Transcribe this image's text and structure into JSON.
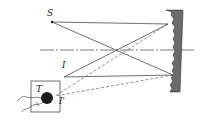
{
  "diagram": {
    "type": "optics-ray-diagram",
    "labels": {
      "source": "S",
      "image": "I",
      "image_prime": "I'",
      "detector": "T"
    },
    "colors": {
      "line": "#333333",
      "mirror_fill": "#6b6b6b",
      "detector_ball": "#1a1a1a",
      "background": "#ffffff"
    },
    "elements": [
      "source point S",
      "concave grating/mirror (serrated)",
      "optical axis",
      "image I",
      "detector box T with ball and leads",
      "image I' (dashed rays)"
    ]
  }
}
